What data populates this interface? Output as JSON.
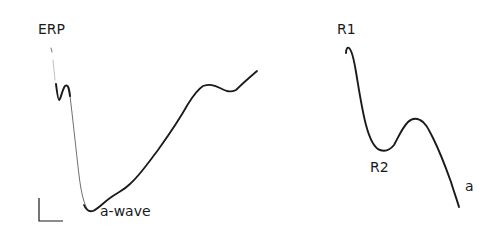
{
  "figure": {
    "left_panel": {
      "labels": {
        "erp": "ERP",
        "a_wave": "a-wave"
      },
      "trace_color": "#1a1a1a",
      "scale_bar": "present (unlabeled L-shaped calibration bar)"
    },
    "right_panel": {
      "labels": {
        "r1": "R1",
        "r2": "R2",
        "a": "a"
      },
      "trace_color": "#1a1a1a"
    }
  }
}
